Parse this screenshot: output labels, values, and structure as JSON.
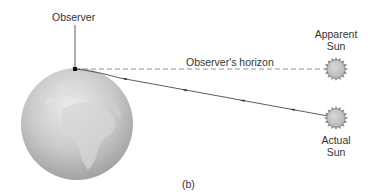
{
  "labels": {
    "observer": "Observer",
    "horizon": "Observer's horizon",
    "apparent_sun_line1": "Apparent",
    "apparent_sun_line2": "Sun",
    "actual_sun_line1": "Actual",
    "actual_sun_line2": "Sun",
    "panel": "(b)"
  },
  "colors": {
    "line": "#333333",
    "dashed": "#888888",
    "sun_fill": "#c8c8c8",
    "globe_light": "#e4e4e4",
    "globe_dark": "#9a9a9a",
    "text": "#333333"
  },
  "icons": {
    "earth": "earth-globe-icon",
    "apparent_sun": "sun-icon",
    "actual_sun": "sun-icon"
  }
}
